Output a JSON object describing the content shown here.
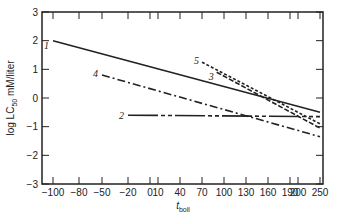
{
  "chart_data": {
    "type": "line",
    "title": "",
    "xlabel": "t_boil",
    "xlabel_main": "t",
    "xlabel_sub": "boil",
    "ylabel": "log LC50  mM/liter",
    "ylabel_parts": {
      "pre": "log  LC",
      "sub": "50",
      "post": "  mM/liter"
    },
    "xlim": [
      -100,
      250
    ],
    "ylim": [
      -3,
      3
    ],
    "x_ticks": [
      "-100",
      "-80",
      "-50",
      "-20",
      "0",
      "10",
      "40",
      "70",
      "100",
      "130",
      "160",
      "190",
      "200",
      "250"
    ],
    "y_ticks": [
      "3",
      "2",
      "1",
      "0",
      "-1",
      "-2",
      "-3"
    ],
    "grid": false,
    "legend": "inline numeric labels",
    "series": [
      {
        "name": "1",
        "style": "solid",
        "x": [
          -100,
          250
        ],
        "y": [
          2.0,
          -0.5
        ]
      },
      {
        "name": "2",
        "style": "solid-dash",
        "x": [
          -20,
          250
        ],
        "y": [
          -0.6,
          -0.65
        ]
      },
      {
        "name": "3",
        "style": "dashed",
        "x": [
          90,
          250
        ],
        "y": [
          0.9,
          -1.05
        ]
      },
      {
        "name": "4",
        "style": "dash-dot",
        "x": [
          -50,
          250
        ],
        "y": [
          0.8,
          -1.35
        ]
      },
      {
        "name": "5",
        "style": "short-dash",
        "x": [
          70,
          250
        ],
        "y": [
          1.25,
          -0.9
        ]
      }
    ]
  }
}
